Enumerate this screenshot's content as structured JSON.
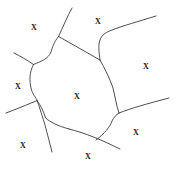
{
  "canvas": {
    "width": 177,
    "height": 169,
    "background_color": "#ffffff",
    "stroke_color": "#3a3a3a",
    "label_color": "#1a1a1a"
  },
  "figure": {
    "type": "line-diagram",
    "label_text": "X"
  },
  "labels": [
    {
      "id": "label-top-left",
      "text": "X",
      "x": 34,
      "y": 28
    },
    {
      "id": "label-top-center",
      "text": "X",
      "x": 98,
      "y": 22
    },
    {
      "id": "label-right",
      "text": "X",
      "x": 146,
      "y": 67
    },
    {
      "id": "label-left",
      "text": "X",
      "x": 18,
      "y": 87
    },
    {
      "id": "label-center",
      "text": "X",
      "x": 77,
      "y": 97
    },
    {
      "id": "label-bottom-right",
      "text": "X",
      "x": 136,
      "y": 133
    },
    {
      "id": "label-bottom-left",
      "text": "X",
      "x": 23,
      "y": 146
    },
    {
      "id": "label-bottom-center",
      "text": "X",
      "x": 88,
      "y": 157
    }
  ],
  "edges": [
    {
      "id": "edge-top-spur",
      "d": "M 72 8 C 67 17, 63 27, 58.5 36.5"
    },
    {
      "id": "edge-top-right-diagonal",
      "d": "M 58.5 36.5 C 72 44, 86 52, 100 60"
    },
    {
      "id": "edge-upper-left-arc",
      "d": "M 58.5 36.5 C 54 42, 52.5 47, 51 52 C 48 59, 42 61, 33.5 64.5"
    },
    {
      "id": "edge-left-outer-top",
      "d": "M 14 53 C 20 56, 27 60, 33.5 64.5"
    },
    {
      "id": "edge-left-inner",
      "d": "M 33.5 64.5 C 29 73, 29.5 81, 31 88 C 32.5 95, 36 97, 37 100.5"
    },
    {
      "id": "edge-left-outer-bottom",
      "d": "M 6 113 C 14 110, 24 106, 31 103 C 34 102, 36 101, 37 100.5"
    },
    {
      "id": "edge-lower-left-spur",
      "d": "M 37 100.5 C 39 105, 41 113, 44.5 123 C 46 129, 49 140, 52 152"
    },
    {
      "id": "edge-lower-mid-inner",
      "d": "M 37 100.5 C 41 106, 44 112, 45.5 118 C 50 122, 58 126, 69 129"
    },
    {
      "id": "edge-bottom-diagonal",
      "d": "M 69 129 C 85 133, 102 140, 120 149"
    },
    {
      "id": "edge-bottom-center-up",
      "d": "M 96 140 C 105 133, 110 127, 112 121 C 114 117, 116 115, 119 113"
    },
    {
      "id": "edge-right-lower-arc",
      "d": "M 100 60 C 105 69, 110 79, 113 88 C 115 96, 116 104, 119 113"
    },
    {
      "id": "edge-right-outer",
      "d": "M 119 113 C 132 108, 146 104, 169 98"
    },
    {
      "id": "edge-upper-right-wave",
      "d": "M 100 60 C 99 52, 98 45, 100 40 C 102 34, 107 32, 112 30 C 122 26, 140 21, 156 16"
    }
  ]
}
